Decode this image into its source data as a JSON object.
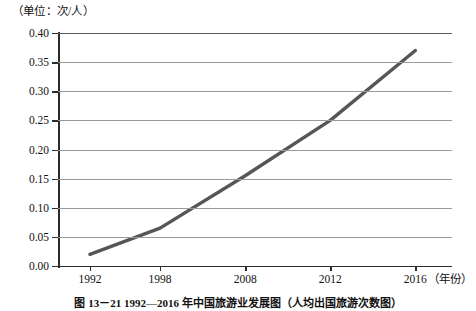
{
  "unit_note": "（单位：次/人）",
  "caption": "图 13－21  1992—2016 年中国旅游业发展图（人均出国旅游次数图）",
  "chart_data": {
    "type": "line",
    "title": "",
    "xlabel": "（年份）",
    "ylabel": "（单位：次/人）",
    "categories": [
      "1992",
      "1998",
      "2008",
      "2012",
      "2016"
    ],
    "values": [
      0.02,
      0.065,
      0.155,
      0.25,
      0.37
    ],
    "yticks": [
      "0.00",
      "0.05",
      "0.10",
      "0.15",
      "0.20",
      "0.25",
      "0.30",
      "0.35",
      "0.40"
    ],
    "ytick_values": [
      0.0,
      0.05,
      0.1,
      0.15,
      0.2,
      0.25,
      0.3,
      0.35,
      0.4
    ],
    "ylim": [
      0.0,
      0.4
    ],
    "grid": "horizontal",
    "legend": "none",
    "series_color": "#55565a",
    "series_width": 3.4
  }
}
